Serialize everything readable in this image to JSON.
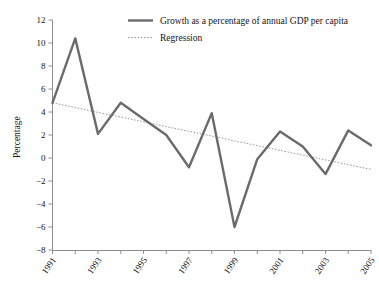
{
  "chart_data": {
    "type": "line",
    "title": "",
    "xlabel": "",
    "ylabel": "Percentage",
    "ylim": [
      -8,
      12
    ],
    "ytick_step": 2,
    "yticks": [
      "12",
      "10",
      "8",
      "6",
      "4",
      "2",
      "0",
      "-2",
      "-4",
      "-6",
      "-8"
    ],
    "xlim": [
      1991,
      2005
    ],
    "x": [
      1991,
      1992,
      1993,
      1994,
      1995,
      1996,
      1997,
      1998,
      1999,
      2000,
      2001,
      2002,
      2003,
      2004,
      2005
    ],
    "xticks_labeled": [
      "1991",
      "1993",
      "1995",
      "1997",
      "1999",
      "2001",
      "2003",
      "2005"
    ],
    "grid": false,
    "legend_position": "top-right",
    "series": [
      {
        "name": "Growth as  a percentage of annual GDP per capita",
        "style": "solid",
        "color": "#6b6b6b",
        "values": [
          4.8,
          10.4,
          2.1,
          4.8,
          3.4,
          2.0,
          -0.8,
          3.9,
          -6.0,
          -0.1,
          2.3,
          1.0,
          -1.4,
          2.4,
          1.1
        ]
      },
      {
        "name": "Regression",
        "style": "dotted",
        "color": "#9a9a9a",
        "values": [
          4.8,
          4.39,
          3.97,
          3.56,
          3.15,
          2.73,
          2.32,
          1.91,
          1.49,
          1.08,
          0.67,
          0.25,
          -0.16,
          -0.58,
          -0.99
        ]
      }
    ]
  },
  "legend": {
    "items": [
      {
        "label": "Growth as  a percentage of annual GDP per capita"
      },
      {
        "label": "Regression"
      }
    ]
  },
  "axes": {
    "y_title": "Percentage",
    "y_labels": [
      "12",
      "10",
      "8",
      "6",
      "4",
      "2",
      "0",
      "-2",
      "-4",
      "-6",
      "-8"
    ],
    "x_labels": [
      "1991",
      "1993",
      "1995",
      "1997",
      "1999",
      "2001",
      "2003",
      "2005"
    ]
  }
}
